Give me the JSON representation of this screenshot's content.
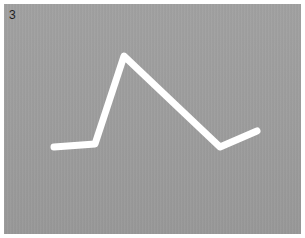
{
  "panel": {
    "label": "3",
    "background_color": "#9c9c9c",
    "stroke_color": "#ffffff"
  },
  "stroke": {
    "description": "white hand-drawn line: flat, sharp rise to a peak, descent to a valley, slight rise",
    "points": [
      [
        54,
        147
      ],
      [
        95,
        144
      ],
      [
        124,
        56
      ],
      [
        220,
        147
      ],
      [
        257,
        131
      ]
    ]
  }
}
